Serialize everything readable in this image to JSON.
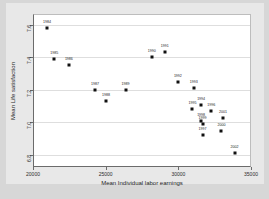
{
  "chart_data": {
    "type": "scatter",
    "title": "",
    "xlabel": "Mean Individual labor earnings",
    "ylabel": "Mean Life satisfaction",
    "xlim": [
      20000,
      35000
    ],
    "ylim": [
      6.72,
      7.66
    ],
    "xticks": [
      20000,
      25000,
      30000,
      35000
    ],
    "xticklabels": [
      "20000",
      "25000",
      "30000",
      "35000"
    ],
    "yticks": [
      6.8,
      7.0,
      7.2,
      7.4,
      7.6
    ],
    "yticklabels": [
      "6.8",
      "7.0",
      "7.2",
      "7.4",
      "7.6"
    ],
    "grid": "horizontal",
    "legend": "none",
    "marker": "filled-square",
    "marker_color": "#111111",
    "points": [
      {
        "label": "1984",
        "x": 20900,
        "y": 7.58,
        "label_pos": "above"
      },
      {
        "label": "1985",
        "x": 21400,
        "y": 7.39,
        "label_pos": "above"
      },
      {
        "label": "1986",
        "x": 22400,
        "y": 7.35,
        "label_pos": "above"
      },
      {
        "label": "1987",
        "x": 24200,
        "y": 7.2,
        "label_pos": "above"
      },
      {
        "label": "1988",
        "x": 24950,
        "y": 7.13,
        "label_pos": "above"
      },
      {
        "label": "1989",
        "x": 26300,
        "y": 7.2,
        "label_pos": "above"
      },
      {
        "label": "1990",
        "x": 28100,
        "y": 7.4,
        "label_pos": "above"
      },
      {
        "label": "1991",
        "x": 29000,
        "y": 7.43,
        "label_pos": "above"
      },
      {
        "label": "1992",
        "x": 29900,
        "y": 7.25,
        "label_pos": "above"
      },
      {
        "label": "1993",
        "x": 31000,
        "y": 7.21,
        "label_pos": "above"
      },
      {
        "label": "1995",
        "x": 30900,
        "y": 7.08,
        "label_pos": "above"
      },
      {
        "label": "1994",
        "x": 31500,
        "y": 7.11,
        "label_pos": "above"
      },
      {
        "label": "1996",
        "x": 32200,
        "y": 7.07,
        "label_pos": "above"
      },
      {
        "label": "1998",
        "x": 31500,
        "y": 7.01,
        "label_pos": "above"
      },
      {
        "label": "1999",
        "x": 31600,
        "y": 6.99,
        "label_pos": "above"
      },
      {
        "label": "2001",
        "x": 33000,
        "y": 7.03,
        "label_pos": "above"
      },
      {
        "label": "2000",
        "x": 32900,
        "y": 6.95,
        "label_pos": "above"
      },
      {
        "label": "1997",
        "x": 31600,
        "y": 6.92,
        "label_pos": "above"
      },
      {
        "label": "2002",
        "x": 33800,
        "y": 6.81,
        "label_pos": "above"
      }
    ]
  }
}
